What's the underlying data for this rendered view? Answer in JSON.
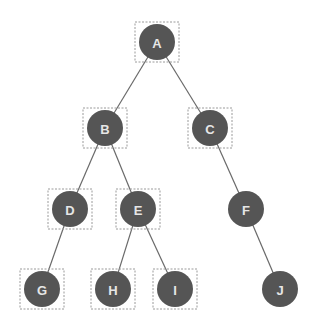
{
  "diagram": {
    "type": "binary-tree",
    "colors": {
      "node_fill": "#555555",
      "label": "#e6e6e6",
      "edge": "#6a6a6a",
      "selection_box": "#9a9a9a",
      "background": "#ffffff"
    },
    "node_radius": 18,
    "nodes": [
      {
        "id": "A",
        "label": "A",
        "x": 157,
        "y": 42,
        "selected": true
      },
      {
        "id": "B",
        "label": "B",
        "x": 105,
        "y": 128,
        "selected": true
      },
      {
        "id": "C",
        "label": "C",
        "x": 210,
        "y": 128,
        "selected": true
      },
      {
        "id": "D",
        "label": "D",
        "x": 70,
        "y": 209,
        "selected": true
      },
      {
        "id": "E",
        "label": "E",
        "x": 138,
        "y": 209,
        "selected": true
      },
      {
        "id": "F",
        "label": "F",
        "x": 246,
        "y": 209,
        "selected": false
      },
      {
        "id": "G",
        "label": "G",
        "x": 42,
        "y": 289,
        "selected": true
      },
      {
        "id": "H",
        "label": "H",
        "x": 113,
        "y": 289,
        "selected": true
      },
      {
        "id": "I",
        "label": "I",
        "x": 175,
        "y": 289,
        "selected": true
      },
      {
        "id": "J",
        "label": "J",
        "x": 280,
        "y": 289,
        "selected": false
      }
    ],
    "edges": [
      {
        "from": "A",
        "to": "B"
      },
      {
        "from": "A",
        "to": "C"
      },
      {
        "from": "B",
        "to": "D"
      },
      {
        "from": "B",
        "to": "E"
      },
      {
        "from": "C",
        "to": "F"
      },
      {
        "from": "D",
        "to": "G"
      },
      {
        "from": "E",
        "to": "H"
      },
      {
        "from": "E",
        "to": "I"
      },
      {
        "from": "F",
        "to": "J"
      }
    ]
  }
}
